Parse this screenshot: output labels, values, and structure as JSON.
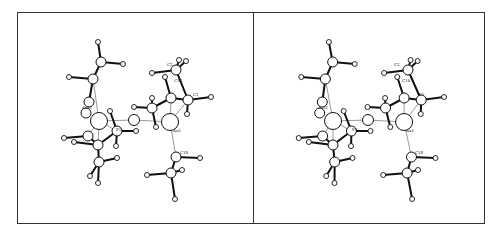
{
  "figure": {
    "type": "stereo-pair molecular structure",
    "panels": [
      "left",
      "right"
    ],
    "labels": [
      "Au1I",
      "C2",
      "C14",
      "C1",
      "F1",
      "Au1",
      "C18"
    ]
  },
  "left": {
    "offset_x": 0,
    "labels": [
      {
        "text": "C2",
        "x": 167,
        "y": 66
      },
      {
        "text": "C14",
        "x": 174,
        "y": 82
      },
      {
        "text": "C1",
        "x": 193,
        "y": 96
      },
      {
        "text": "Au1I",
        "x": 82,
        "y": 109
      },
      {
        "text": "F1",
        "x": 116,
        "y": 131
      },
      {
        "text": "Au1",
        "x": 173,
        "y": 132
      },
      {
        "text": "C18",
        "x": 180,
        "y": 154
      }
    ]
  },
  "right": {
    "offset_x": 234,
    "labels": [
      {
        "text": "C2",
        "x": 160,
        "y": 66
      },
      {
        "text": "C14",
        "x": 168,
        "y": 82
      },
      {
        "text": "F1",
        "x": 185,
        "y": 96
      },
      {
        "text": "Au1I",
        "x": 84,
        "y": 109
      },
      {
        "text": "F1",
        "x": 118,
        "y": 131
      },
      {
        "text": "Au1",
        "x": 172,
        "y": 132
      },
      {
        "text": "C18",
        "x": 181,
        "y": 154
      }
    ]
  },
  "atoms": {
    "large": [
      [
        99,
        121
      ],
      [
        170,
        122
      ]
    ],
    "medium": [
      [
        134,
        120
      ]
    ],
    "small": [
      [
        101,
        62
      ],
      [
        93,
        79
      ],
      [
        89,
        102
      ],
      [
        117,
        131
      ],
      [
        98,
        145
      ],
      [
        88,
        136
      ],
      [
        86,
        113
      ],
      [
        99,
        162
      ],
      [
        176,
        70
      ],
      [
        171,
        98
      ],
      [
        188,
        100
      ],
      [
        152,
        108
      ],
      [
        176,
        157
      ],
      [
        171,
        173
      ]
    ],
    "h": [
      [
        98,
        42
      ],
      [
        123,
        64
      ],
      [
        69,
        77
      ],
      [
        110,
        111
      ],
      [
        136,
        131
      ],
      [
        116,
        146
      ],
      [
        64,
        138
      ],
      [
        74,
        142
      ],
      [
        98,
        183
      ],
      [
        117,
        158
      ],
      [
        90,
        176
      ],
      [
        179,
        60
      ],
      [
        186,
        61
      ],
      [
        152,
        73
      ],
      [
        165,
        77
      ],
      [
        211,
        97
      ],
      [
        187,
        114
      ],
      [
        152,
        98
      ],
      [
        134,
        107
      ],
      [
        156,
        127
      ],
      [
        200,
        158
      ],
      [
        147,
        175
      ],
      [
        182,
        170
      ],
      [
        175,
        199
      ]
    ],
    "bonds": [
      [
        101,
        62,
        98,
        42
      ],
      [
        101,
        62,
        123,
        64
      ],
      [
        101,
        62,
        93,
        79
      ],
      [
        93,
        79,
        69,
        77
      ],
      [
        93,
        79,
        89,
        102
      ],
      [
        117,
        131,
        136,
        131
      ],
      [
        117,
        131,
        116,
        146
      ],
      [
        117,
        131,
        110,
        111
      ],
      [
        117,
        131,
        98,
        145
      ],
      [
        98,
        145,
        88,
        136
      ],
      [
        88,
        136,
        64,
        138
      ],
      [
        98,
        145,
        74,
        142
      ],
      [
        98,
        145,
        99,
        162
      ],
      [
        99,
        162,
        98,
        183
      ],
      [
        99,
        162,
        117,
        158
      ],
      [
        99,
        162,
        90,
        176
      ],
      [
        176,
        70,
        179,
        60
      ],
      [
        176,
        70,
        186,
        61
      ],
      [
        176,
        70,
        152,
        73
      ],
      [
        176,
        70,
        188,
        100
      ],
      [
        171,
        98,
        165,
        77
      ],
      [
        171,
        98,
        188,
        100
      ],
      [
        188,
        100,
        211,
        97
      ],
      [
        188,
        100,
        187,
        114
      ],
      [
        171,
        98,
        152,
        108
      ],
      [
        152,
        108,
        152,
        98
      ],
      [
        152,
        108,
        134,
        107
      ],
      [
        152,
        108,
        156,
        127
      ],
      [
        176,
        157,
        200,
        158
      ],
      [
        176,
        157,
        171,
        173
      ],
      [
        171,
        173,
        147,
        175
      ],
      [
        171,
        173,
        182,
        170
      ],
      [
        171,
        173,
        175,
        199
      ]
    ],
    "thin": [
      [
        93,
        79,
        99,
        121
      ],
      [
        99,
        121,
        134,
        120
      ],
      [
        134,
        120,
        170,
        122
      ],
      [
        170,
        122,
        176,
        157
      ],
      [
        170,
        122,
        171,
        98
      ],
      [
        170,
        122,
        188,
        100
      ],
      [
        99,
        121,
        117,
        131
      ],
      [
        99,
        121,
        98,
        145
      ],
      [
        99,
        121,
        88,
        136
      ]
    ]
  }
}
